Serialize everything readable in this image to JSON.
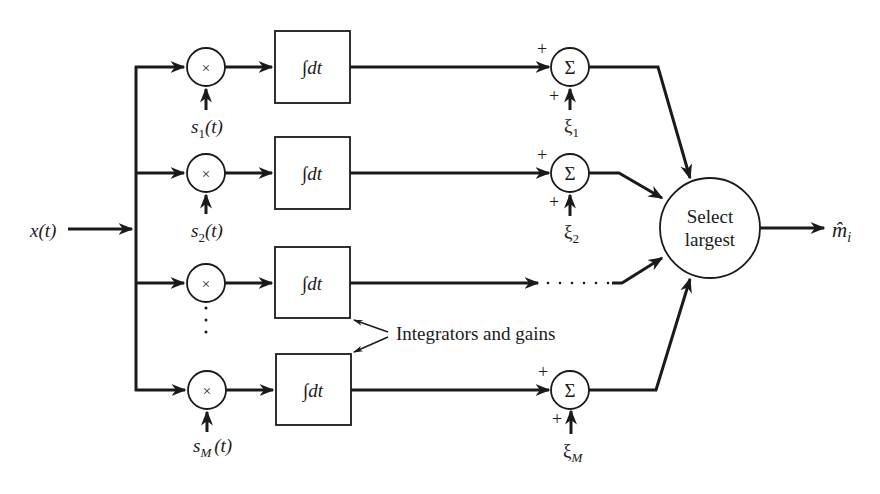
{
  "diagram": {
    "type": "block-diagram",
    "input": {
      "label": "x(t)"
    },
    "output": {
      "label": "m̂",
      "subscript": "i"
    },
    "multiplier_symbol": "×",
    "integrator_label": "∫dt",
    "sum_symbol": "Σ",
    "plus_sign": "+",
    "selector": {
      "line1": "Select",
      "line2": "largest"
    },
    "annotation": "Integrators and gains",
    "ellipsis_vertical": "·  ·  ·",
    "ellipsis_horizontal": "· · · · · · ·",
    "branches": [
      {
        "id": "1",
        "reference": {
          "base": "s",
          "sub": "1",
          "arg": "(t)"
        },
        "noise": {
          "base": "ξ",
          "sub": "1"
        }
      },
      {
        "id": "2",
        "reference": {
          "base": "s",
          "sub": "2",
          "arg": "(t)"
        },
        "noise": {
          "base": "ξ",
          "sub": "2"
        }
      },
      {
        "id": "3",
        "reference": null,
        "noise": null
      },
      {
        "id": "M",
        "reference": {
          "base": "s",
          "sub": "M",
          "arg": "(t)"
        },
        "noise": {
          "base": "ξ",
          "sub": "M"
        }
      }
    ],
    "colors": {
      "ink": "#1a1a1a",
      "background": "#ffffff"
    }
  }
}
